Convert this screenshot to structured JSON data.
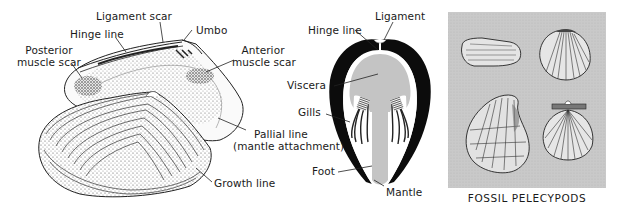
{
  "figure": {
    "clam_shell": {
      "labels": {
        "ligament_scar": "Ligament scar",
        "umbo": "Umbo",
        "hinge_line": "Hinge line",
        "posterior_muscle_scar_1": "Posterior",
        "posterior_muscle_scar_2": "muscle scar",
        "anterior_muscle_scar_1": "Anterior",
        "anterior_muscle_scar_2": "muscle scar",
        "pallial_line_1": "Pallial line",
        "pallial_line_2": "(mantle attachment)",
        "growth_line": "Growth line"
      }
    },
    "cross_section": {
      "labels": {
        "hinge_line": "Hinge line",
        "ligament": "Ligament",
        "viscera": "Viscera",
        "gills": "Gills",
        "foot": "Foot",
        "mantle": "Mantle"
      }
    },
    "fossil_panel": {
      "caption": "FOSSIL  PELECYPODS",
      "background": "#c8c8c8",
      "specimens": [
        "elongate-clam",
        "cockle",
        "oyster",
        "scallop"
      ]
    }
  }
}
